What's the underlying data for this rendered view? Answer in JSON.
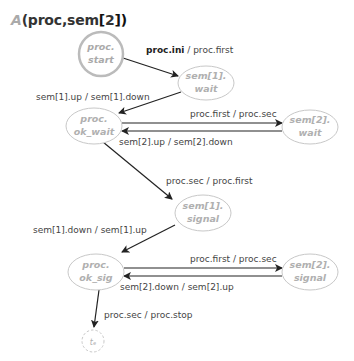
{
  "title": {
    "prefix": "A",
    "args": "(proc,sem",
    "bracket_open": "[",
    "index": "2",
    "bracket_close": "])"
  },
  "nodes": {
    "start": {
      "line1": "proc.",
      "line2": "start"
    },
    "sem1_wait": {
      "line1": "sem[1].",
      "line2": "wait"
    },
    "ok_wait": {
      "line1": "proc.",
      "line2": "ok_wait"
    },
    "sem2_wait": {
      "line1": "sem[2].",
      "line2": "wait"
    },
    "sem1_signal": {
      "line1": "sem[1].",
      "line2": "signal"
    },
    "ok_sig": {
      "line1": "proc.",
      "line2": "ok_sig"
    },
    "sem2_signal": {
      "line1": "sem[2].",
      "line2": "signal"
    },
    "end": {
      "label": "tₑ"
    }
  },
  "edges": {
    "start_to_sem1wait": {
      "trigger": "proc.ini",
      "action": " / proc.first"
    },
    "sem1wait_to_okwait": {
      "label": "sem[1].up / sem[1].down"
    },
    "okwait_to_sem2wait": {
      "label": "proc.first / proc.sec"
    },
    "sem2wait_to_okwait": {
      "label": "sem[2].up / sem[2].down"
    },
    "okwait_to_sem1signal": {
      "label": "proc.sec / proc.first"
    },
    "sem1signal_to_oksig": {
      "label": "sem[1].down / sem[1].up"
    },
    "oksig_to_sem2signal": {
      "label": "proc.first / proc.sec"
    },
    "sem2signal_to_oksig": {
      "label": "sem[2].down / sem[2].up"
    },
    "oksig_to_end": {
      "label": "proc.sec / proc.stop"
    }
  },
  "colors": {
    "node_stroke": "#c8c8c8",
    "start_stroke": "#bbbbbb",
    "node_text": "#b0b0b0",
    "edge": "#222222",
    "edge_text": "#444444"
  }
}
